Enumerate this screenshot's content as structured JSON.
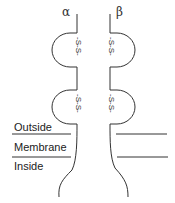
{
  "diagram": {
    "chains": [
      {
        "name": "alpha",
        "symbol": "α"
      },
      {
        "name": "beta",
        "symbol": "β"
      }
    ],
    "disulfide_label": "-S-S-",
    "regions": {
      "outside": "Outside",
      "membrane": "Membrane",
      "inside": "Inside"
    },
    "colors": {
      "line": "#333333",
      "text": "#222222",
      "background": "#ffffff"
    }
  }
}
